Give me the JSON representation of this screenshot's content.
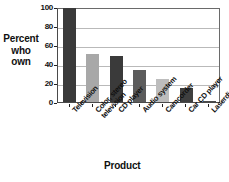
{
  "chart_data": {
    "type": "bar",
    "title": "",
    "subtitle": "",
    "xlabel": "Product",
    "ylabel": "Percent who own",
    "ylabel_lines": [
      "Percent",
      "who",
      "own"
    ],
    "categories": [
      "Television",
      "Color, stereo television",
      "CD player",
      "Audio system",
      "Camcorder",
      "Car CD player",
      "Laserdisc player"
    ],
    "category_lines": [
      [
        "Television"
      ],
      [
        "Color, stereo",
        "television"
      ],
      [
        "CD player"
      ],
      [
        "Audio system"
      ],
      [
        "Camcorder"
      ],
      [
        "Car CD player"
      ],
      [
        "Laserdisc player"
      ]
    ],
    "values": [
      99,
      51,
      48,
      34,
      24,
      15,
      1
    ],
    "ylim": [
      0,
      100
    ],
    "yticks": [
      0,
      20,
      40,
      60,
      80,
      100
    ],
    "ytick_labels": [
      "0",
      "20",
      "40",
      "60",
      "80",
      "100"
    ],
    "grid": true,
    "grid_axis": "y",
    "legend": false,
    "bar_colors": [
      "#3a3a3a",
      "#a8a8a8",
      "#3a3a3a",
      "#5c5c5c",
      "#bdbdbd",
      "#3f3f3f",
      "#4a4a4a"
    ]
  },
  "colors": {
    "background": "#ffffff",
    "axis": "#4a4a4a",
    "gridline": "#b9b9b9",
    "text": "#101010"
  }
}
